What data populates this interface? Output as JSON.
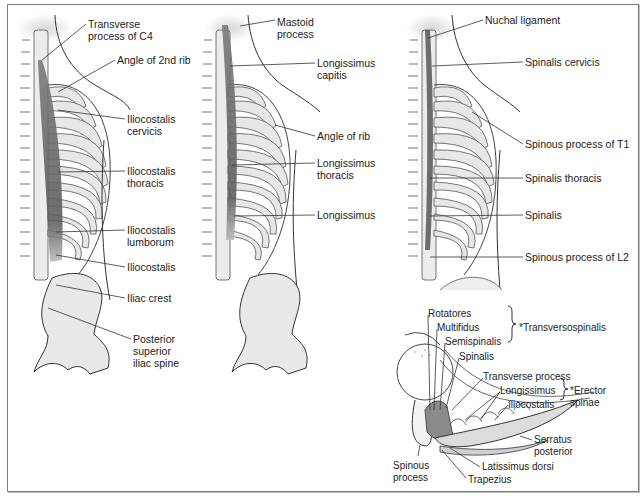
{
  "figure": {
    "panels": [
      {
        "id": "iliocostalis",
        "labels": [
          {
            "text": "Transverse\nprocess of C4",
            "x": 88,
            "y": 18
          },
          {
            "text": "Angle of 2nd rib",
            "x": 117,
            "y": 54
          },
          {
            "text": "Iliocostalis\ncervicis",
            "x": 127,
            "y": 113
          },
          {
            "text": "Iliocostalis\nthoracis",
            "x": 127,
            "y": 165
          },
          {
            "text": "Iliocostalis\nlumborum",
            "x": 127,
            "y": 224
          },
          {
            "text": "Iliocostalis",
            "x": 127,
            "y": 261
          },
          {
            "text": "Iliac crest",
            "x": 127,
            "y": 292
          },
          {
            "text": "Posterior\nsuperior\niliac spine",
            "x": 133,
            "y": 333
          }
        ]
      },
      {
        "id": "longissimus",
        "labels": [
          {
            "text": "Mastoid\nprocess",
            "x": 277,
            "y": 16
          },
          {
            "text": "Longissimus\ncapitis",
            "x": 317,
            "y": 57
          },
          {
            "text": "Angle of rib",
            "x": 317,
            "y": 130
          },
          {
            "text": "Longissimus\nthoracis",
            "x": 317,
            "y": 157
          },
          {
            "text": "Longissimus",
            "x": 317,
            "y": 209
          }
        ]
      },
      {
        "id": "spinalis",
        "labels": [
          {
            "text": "Nuchal ligament",
            "x": 485,
            "y": 14
          },
          {
            "text": "Spinalis cervicis",
            "x": 525,
            "y": 56
          },
          {
            "text": "Spinous process of T1",
            "x": 525,
            "y": 138
          },
          {
            "text": "Spinalis thoracis",
            "x": 525,
            "y": 172
          },
          {
            "text": "Spinalis",
            "x": 525,
            "y": 209
          },
          {
            "text": "Spinous process of L2",
            "x": 525,
            "y": 251
          }
        ]
      },
      {
        "id": "cross-section",
        "labels": [
          {
            "text": "Rotatores",
            "x": 428,
            "y": 308
          },
          {
            "text": "Multifidus",
            "x": 437,
            "y": 322
          },
          {
            "text": "Semispinalis",
            "x": 445,
            "y": 336
          },
          {
            "text": "Spinalis",
            "x": 459,
            "y": 351
          },
          {
            "text": "Transverse process",
            "x": 483,
            "y": 371
          },
          {
            "text": "Longissimus",
            "x": 500,
            "y": 385
          },
          {
            "text": "Iliocostalis",
            "x": 508,
            "y": 399
          },
          {
            "text": "Serratus\nposterior",
            "x": 534,
            "y": 434
          },
          {
            "text": "Latissimus dorsi",
            "x": 482,
            "y": 461
          },
          {
            "text": "Spinous\nprocess",
            "x": 393,
            "y": 460
          },
          {
            "text": "Trapezius",
            "x": 468,
            "y": 474
          }
        ],
        "groups": [
          {
            "text": "*Transversospinalis",
            "x": 519,
            "y": 322
          },
          {
            "text": "*Erector\nspinae",
            "x": 570,
            "y": 385
          }
        ]
      }
    ],
    "colors": {
      "muscle": "#6e6e6e",
      "bone": "#e6e6e6",
      "outline": "#333333",
      "border": "#7a7a7a"
    }
  }
}
